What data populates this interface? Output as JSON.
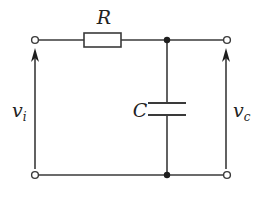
{
  "diagram": {
    "type": "RC low-pass circuit",
    "components": {
      "resistor": {
        "label": "R"
      },
      "capacitor": {
        "label": "C"
      }
    },
    "voltages": {
      "input": {
        "label": "v",
        "subscript": "i"
      },
      "output": {
        "label": "v",
        "subscript": "c"
      }
    },
    "colors": {
      "wire": "#3a3a3a",
      "junction": "#1e1e1e",
      "background": "#ffffff"
    }
  }
}
